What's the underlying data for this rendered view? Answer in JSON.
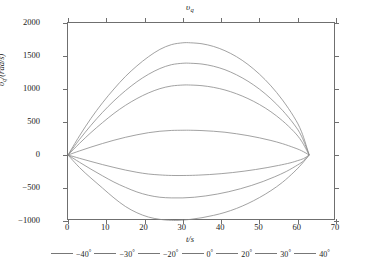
{
  "chart_data": {
    "type": "line",
    "title": "υq",
    "title_base": "υ",
    "title_sub": "q",
    "xlabel": "t/s",
    "ylabel": "υq/(rad/s)",
    "ylabel_base": "υ",
    "ylabel_sub": "q",
    "ylabel_rest": "/(rad/s)",
    "xlim": [
      0,
      70
    ],
    "ylim": [
      -1000,
      2000
    ],
    "xticks": [
      0,
      10,
      20,
      30,
      40,
      50,
      60,
      70
    ],
    "yticks": [
      -1000,
      -500,
      0,
      500,
      1000,
      1500,
      2000
    ],
    "grid": false,
    "legend_position": "below-axes",
    "line_color": "#8a8a8a",
    "axis_color": "#6f6f6f",
    "x_start": 0,
    "x_end": 63,
    "series": [
      {
        "name": "-40°",
        "label_value": "−40",
        "peak": -990,
        "peak_time": 29,
        "x": [
          0,
          3,
          6,
          9,
          12,
          15,
          18,
          21,
          24,
          27,
          29,
          32,
          35,
          38,
          41,
          44,
          47,
          50,
          53,
          56,
          59,
          61,
          63
        ],
        "y": [
          0,
          -190,
          -350,
          -500,
          -650,
          -780,
          -875,
          -940,
          -975,
          -990,
          -990,
          -975,
          -950,
          -915,
          -870,
          -810,
          -735,
          -645,
          -540,
          -415,
          -260,
          -140,
          0
        ]
      },
      {
        "name": "-30°",
        "label_value": "−30",
        "peak": -650,
        "peak_time": 30,
        "x": [
          0,
          3,
          6,
          9,
          12,
          15,
          18,
          21,
          24,
          27,
          30,
          33,
          36,
          39,
          42,
          45,
          48,
          51,
          54,
          57,
          60,
          61.5,
          63
        ],
        "y": [
          0,
          -110,
          -215,
          -315,
          -410,
          -490,
          -560,
          -610,
          -640,
          -650,
          -650,
          -640,
          -620,
          -592,
          -556,
          -512,
          -460,
          -400,
          -330,
          -250,
          -150,
          -90,
          0
        ]
      },
      {
        "name": "-20°",
        "label_value": "−20",
        "peak": -310,
        "peak_time": 31,
        "x": [
          0,
          3,
          6,
          9,
          12,
          15,
          18,
          21,
          24,
          27,
          31,
          34,
          37,
          40,
          43,
          46,
          49,
          52,
          55,
          58,
          60,
          61.5,
          63
        ],
        "y": [
          0,
          -50,
          -98,
          -145,
          -188,
          -228,
          -262,
          -288,
          -302,
          -310,
          -310,
          -305,
          -296,
          -283,
          -266,
          -245,
          -220,
          -191,
          -158,
          -120,
          -85,
          -55,
          0
        ]
      },
      {
        "name": "0°",
        "label_value": "0",
        "peak": 375,
        "peak_time": 32,
        "x": [
          0,
          3,
          6,
          9,
          12,
          15,
          18,
          21,
          24,
          27,
          30,
          32,
          35,
          38,
          41,
          44,
          47,
          50,
          53,
          56,
          59,
          61,
          63
        ],
        "y": [
          0,
          62,
          120,
          174,
          224,
          268,
          306,
          338,
          360,
          372,
          375,
          375,
          370,
          360,
          345,
          322,
          294,
          260,
          220,
          172,
          112,
          65,
          0
        ]
      },
      {
        "name": "20°",
        "label_value": "20",
        "peak": 1060,
        "peak_time": 32,
        "x": [
          0,
          3,
          6,
          9,
          12,
          15,
          18,
          21,
          24,
          27,
          30,
          32,
          35,
          38,
          41,
          44,
          47,
          50,
          53,
          56,
          59,
          61,
          63
        ],
        "y": [
          0,
          176,
          340,
          490,
          630,
          752,
          855,
          940,
          1005,
          1045,
          1060,
          1060,
          1050,
          1025,
          985,
          928,
          855,
          765,
          655,
          520,
          355,
          210,
          0
        ]
      },
      {
        "name": "30°",
        "label_value": "30",
        "peak": 1390,
        "peak_time": 32,
        "x": [
          0,
          3,
          6,
          9,
          12,
          15,
          18,
          21,
          24,
          27,
          30,
          32,
          35,
          38,
          41,
          44,
          47,
          50,
          53,
          56,
          59,
          61,
          63
        ],
        "y": [
          0,
          235,
          450,
          645,
          820,
          975,
          1110,
          1222,
          1310,
          1368,
          1390,
          1390,
          1378,
          1345,
          1292,
          1215,
          1118,
          998,
          852,
          678,
          468,
          285,
          0
        ]
      },
      {
        "name": "40°",
        "label_value": "40",
        "peak": 1700,
        "peak_time": 32,
        "x": [
          0,
          3,
          6,
          9,
          12,
          15,
          18,
          21,
          24,
          27,
          30,
          32,
          35,
          38,
          41,
          44,
          47,
          50,
          53,
          56,
          59,
          61,
          63
        ],
        "y": [
          0,
          290,
          555,
          790,
          1000,
          1190,
          1350,
          1488,
          1600,
          1672,
          1700,
          1700,
          1685,
          1645,
          1580,
          1490,
          1372,
          1225,
          1048,
          835,
          578,
          352,
          0
        ]
      }
    ]
  },
  "legend": {
    "items": [
      {
        "label": "−40°"
      },
      {
        "label": "−30°"
      },
      {
        "label": "−20°"
      },
      {
        "label": "0°"
      },
      {
        "label": "20°"
      },
      {
        "label": "30°"
      },
      {
        "label": "40°"
      }
    ]
  }
}
